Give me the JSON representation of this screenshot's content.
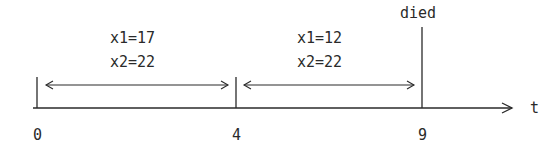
{
  "diagram": {
    "axis": {
      "label": "t"
    },
    "ticks": [
      {
        "label": "0",
        "value": 0
      },
      {
        "label": "4",
        "value": 4
      },
      {
        "label": "9",
        "value": 9
      }
    ],
    "event": {
      "label": "died",
      "at": "9"
    },
    "intervals": [
      {
        "from": "0",
        "to": "4",
        "line1": "x1=17",
        "line2": "x2=22"
      },
      {
        "from": "4",
        "to": "9",
        "line1": "x1=12",
        "line2": "x2=22"
      }
    ],
    "colors": {
      "ink": "#2a2a2a",
      "background": "#ffffff"
    }
  }
}
